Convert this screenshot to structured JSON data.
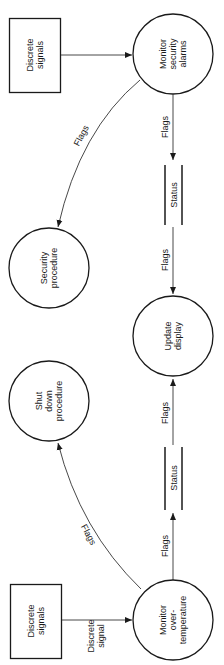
{
  "diagram": {
    "type": "data-flow-diagram",
    "orientation": "rotated-90-ccw",
    "externals": [
      {
        "id": "ext-top",
        "lines": [
          "Discrete",
          "signals"
        ]
      },
      {
        "id": "ext-bottom",
        "lines": [
          "Discrete",
          "signals"
        ]
      }
    ],
    "processes": [
      {
        "id": "monitor-security",
        "lines": [
          "Monitor",
          "security",
          "alarms"
        ]
      },
      {
        "id": "security-procedure",
        "lines": [
          "Security",
          "procedure"
        ]
      },
      {
        "id": "update-display",
        "lines": [
          "Update",
          "display"
        ]
      },
      {
        "id": "shutdown-procedure",
        "lines": [
          "Shut",
          "down",
          "procedure"
        ]
      },
      {
        "id": "monitor-overtemp",
        "lines": [
          "Monitor",
          "over-",
          "temperature"
        ]
      }
    ],
    "stores": [
      {
        "id": "status-top",
        "label": "Status"
      },
      {
        "id": "status-bottom",
        "label": "Status"
      }
    ],
    "flows": [
      {
        "from": "ext-top",
        "to": "monitor-security",
        "lines": []
      },
      {
        "from": "monitor-security",
        "to": "security-procedure",
        "lines": [
          "Flags"
        ]
      },
      {
        "from": "monitor-security",
        "to": "status-top",
        "lines": [
          "Flags"
        ]
      },
      {
        "from": "status-top",
        "to": "update-display",
        "lines": [
          "Flags"
        ]
      },
      {
        "from": "status-bottom",
        "to": "update-display",
        "lines": [
          "Flags"
        ]
      },
      {
        "from": "monitor-overtemp",
        "to": "status-bottom",
        "lines": [
          "Flags"
        ]
      },
      {
        "from": "monitor-overtemp",
        "to": "shutdown-procedure",
        "lines": [
          "Flags"
        ]
      },
      {
        "from": "ext-bottom",
        "to": "monitor-overtemp",
        "lines": [
          "Discrete",
          "signal"
        ]
      }
    ]
  }
}
